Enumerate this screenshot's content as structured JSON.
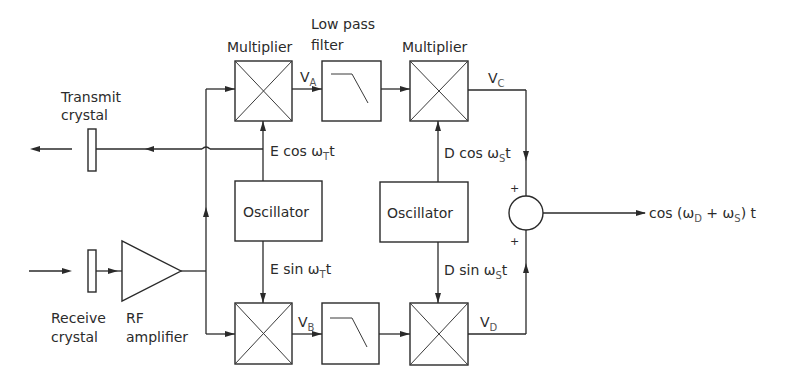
{
  "diagram": {
    "type": "block-diagram",
    "labels": {
      "transmit_crystal": [
        "Transmit",
        "crystal"
      ],
      "receive_crystal": [
        "Receive",
        "crystal"
      ],
      "rf_amplifier": [
        "RF",
        "amplifier"
      ],
      "low_pass_filter": [
        "Low pass",
        "filter"
      ],
      "multiplier_top_left": "Multiplier",
      "multiplier_top_right": "Multiplier",
      "oscillator_left": "Oscillator",
      "oscillator_right": "Oscillator"
    },
    "signals": {
      "va": {
        "main": "V",
        "sub": "A"
      },
      "vb": {
        "main": "V",
        "sub": "B"
      },
      "vc": {
        "main": "V",
        "sub": "C"
      },
      "vd": {
        "main": "V",
        "sub": "D"
      },
      "e_cos": {
        "main": "E cos ω",
        "sub": "T",
        "tail": "t"
      },
      "e_sin": {
        "main": "E sin ω",
        "sub": "T",
        "tail": "t"
      },
      "d_cos": {
        "main": "D cos ω",
        "sub": "S",
        "tail": "t"
      },
      "d_sin": {
        "main": "D sin ω",
        "sub": "S",
        "tail": "t"
      },
      "output": {
        "p1": "cos (ω",
        "s1": "D",
        "p2": " + ω",
        "s2": "S",
        "p3": ") t"
      }
    },
    "summer_signs": {
      "top": "+",
      "bottom": "+"
    }
  }
}
